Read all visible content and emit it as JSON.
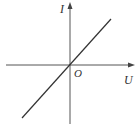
{
  "diagram": {
    "type": "I-U characteristic graph",
    "y_axis_label": "I",
    "x_axis_label": "U",
    "origin_label": "O",
    "line": {
      "description": "straight line through origin with positive slope",
      "from": [
        22,
        118
      ],
      "to": [
        111,
        19
      ]
    },
    "colors": {
      "axis": "#444444",
      "line": "#333333",
      "text": "#333333",
      "background": "#ffffff"
    }
  }
}
